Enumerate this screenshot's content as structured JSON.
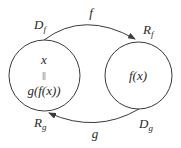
{
  "diagram": {
    "type": "function-composition-mapping",
    "colors": {
      "stroke": "#3a3a3a",
      "text": "#2a2a2a",
      "background": "#ffffff"
    },
    "sets": [
      {
        "id": "left",
        "top_label": {
          "main": "D",
          "sub": "f"
        },
        "bottom_label": {
          "main": "R",
          "sub": "g"
        },
        "content": {
          "line1": "x",
          "line2": "||",
          "line3": "g(f(x))"
        }
      },
      {
        "id": "right",
        "top_label": {
          "main": "R",
          "sub": "f"
        },
        "bottom_label": {
          "main": "D",
          "sub": "g"
        },
        "content": {
          "line1": "f(x)"
        }
      }
    ],
    "arrows": [
      {
        "label": "f",
        "from": "left",
        "to": "right",
        "position": "top"
      },
      {
        "label": "g",
        "from": "right",
        "to": "left",
        "position": "bottom"
      }
    ]
  }
}
